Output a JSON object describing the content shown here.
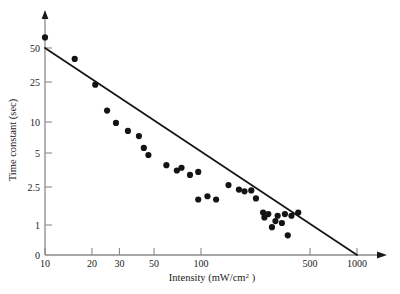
{
  "chart_data": {
    "type": "scatter",
    "title": "",
    "subtitle": "",
    "xlabel": "Intensity (mW/cm2 )",
    "xlabel_main": "Intensity (mW/cm",
    "xlabel_sup": "2",
    "xlabel_tail": " )",
    "ylabel": "Time constant (sec)",
    "xscale": "log",
    "yscale": "log",
    "grid": false,
    "legend": null,
    "xlim": [
      10,
      1300
    ],
    "ylim": [
      0,
      70
    ],
    "xticks": [
      {
        "value": 10,
        "label": "10"
      },
      {
        "value": 20,
        "label": "20"
      },
      {
        "value": 30,
        "label": "30"
      },
      {
        "value": 50,
        "label": "50"
      },
      {
        "value": 100,
        "label": "100"
      },
      {
        "value": 500,
        "label": "500"
      },
      {
        "value": 1000,
        "label": "1000"
      }
    ],
    "yticks": [
      {
        "value": 50,
        "label": "50"
      },
      {
        "value": 25,
        "label": "25"
      },
      {
        "value": 10,
        "label": "10"
      },
      {
        "value": 5,
        "label": "5"
      },
      {
        "value": 2.5,
        "label": "2.5"
      },
      {
        "value": 1,
        "label": "1"
      },
      {
        "value": 0,
        "label": "0"
      }
    ],
    "series": [
      {
        "name": "measurements",
        "marker": "filled-circle",
        "color": "#141414",
        "points": [
          [
            10,
            62
          ],
          [
            15.5,
            40
          ],
          [
            21,
            23.5
          ],
          [
            25,
            13
          ],
          [
            28.5,
            9.8
          ],
          [
            34,
            8.2
          ],
          [
            40,
            7.3
          ],
          [
            43,
            5.6
          ],
          [
            46,
            4.8
          ],
          [
            60,
            3.9
          ],
          [
            70,
            3.5
          ],
          [
            75,
            3.7
          ],
          [
            85,
            3.2
          ],
          [
            96,
            3.4
          ],
          [
            96,
            1.85
          ],
          [
            110,
            2.0
          ],
          [
            125,
            1.85
          ],
          [
            150,
            2.6
          ],
          [
            175,
            2.35
          ],
          [
            190,
            2.25
          ],
          [
            210,
            2.3
          ],
          [
            225,
            1.9
          ],
          [
            250,
            1.35
          ],
          [
            255,
            1.2
          ],
          [
            270,
            1.3
          ],
          [
            285,
            0.95
          ],
          [
            300,
            1.1
          ],
          [
            310,
            1.25
          ],
          [
            330,
            1.05
          ],
          [
            345,
            1.3
          ],
          [
            360,
            0.78
          ],
          [
            380,
            1.25
          ],
          [
            420,
            1.35
          ]
        ]
      }
    ],
    "fit_line": {
      "name": "regression-line",
      "color": "#141414",
      "start": [
        10,
        50
      ],
      "end": [
        1000,
        0
      ],
      "note": "straight line on log-log axes from (10, 50) to (1000, 0)"
    }
  },
  "axes": {
    "y_arrow": "up-arrow",
    "x_arrow": "right-arrow"
  }
}
